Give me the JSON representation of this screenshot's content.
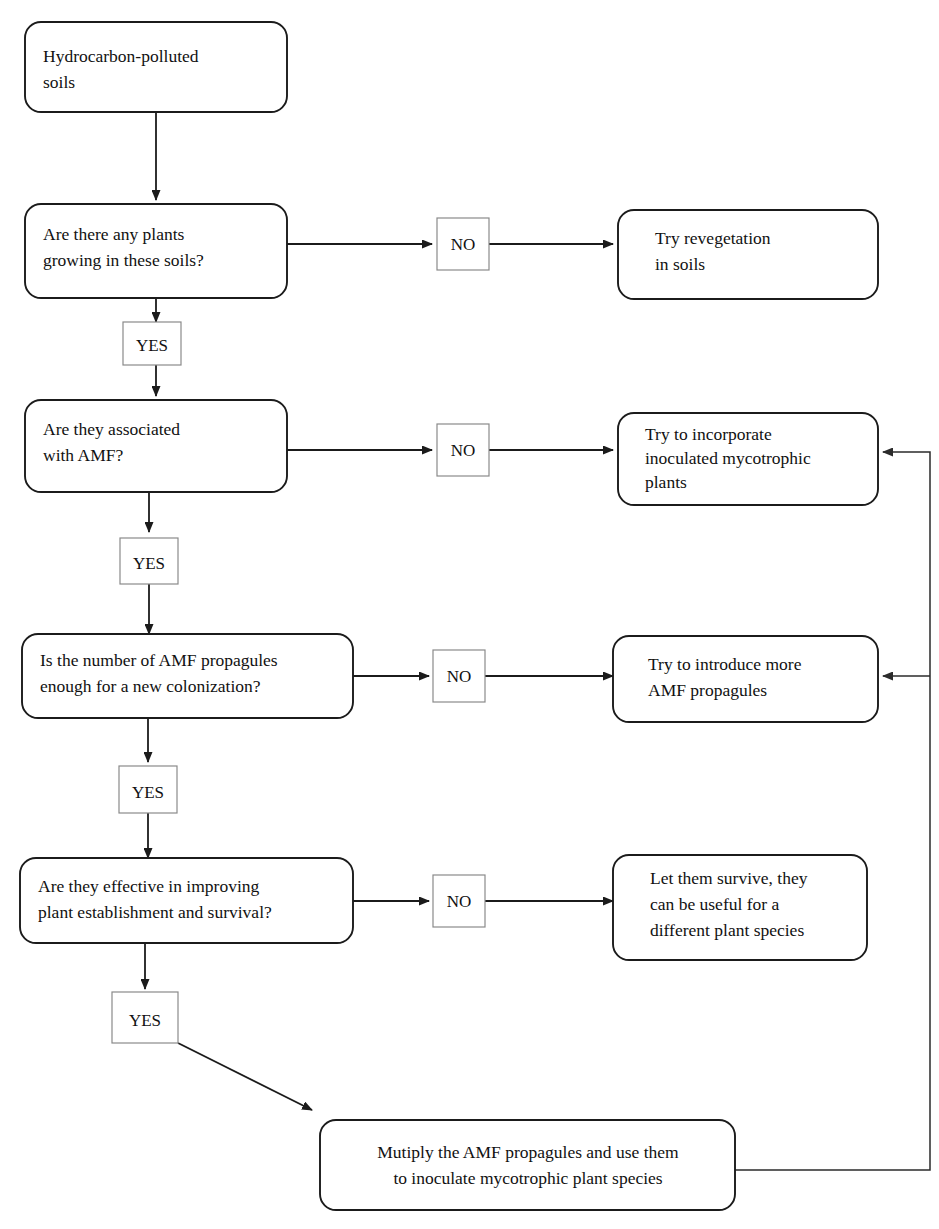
{
  "diagram": {
    "colors": {
      "node_stroke": "#1b1b1b",
      "label_stroke": "#8a8a8a",
      "connector": "#1b1b1b",
      "background": "#ffffff",
      "text": "#111111"
    },
    "nodes": {
      "start": {
        "line1": "Hydrocarbon-polluted",
        "line2": "soils"
      },
      "q1": {
        "line1": "Are there any plants",
        "line2": "growing in these soils?"
      },
      "q2": {
        "line1": "Are they associated",
        "line2": "with AMF?"
      },
      "q3": {
        "line1": "Is the number of AMF propagules",
        "line2": "enough for a new colonization?"
      },
      "q4": {
        "line1": "Are they effective in improving",
        "line2": "plant establishment and survival?"
      },
      "a1": {
        "line1": "Try revegetation",
        "line2": "in soils"
      },
      "a2": {
        "line1": "Try to incorporate",
        "line2": "inoculated mycotrophic",
        "line3": "plants"
      },
      "a3": {
        "line1": "Try to introduce more",
        "line2": "AMF propagules"
      },
      "a4": {
        "line1": "Let them survive, they",
        "line2": "can be useful for a",
        "line3": "different plant species"
      },
      "final": {
        "line1": "Mutiply the AMF propagules and use them",
        "line2": "to inoculate mycotrophic plant species"
      }
    },
    "edge_labels": {
      "no1": "NO",
      "no2": "NO",
      "no3": "NO",
      "no4": "NO",
      "yes1": "YES",
      "yes2": "YES",
      "yes3": "YES",
      "yes4": "YES"
    }
  }
}
